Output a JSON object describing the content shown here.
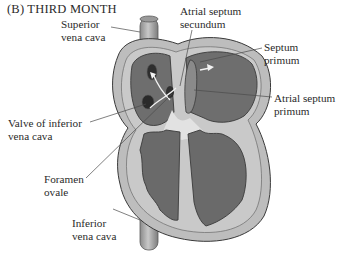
{
  "title": "(B)  THIRD MONTH",
  "labels": {
    "superior_vena_cava": "Superior\nvena cava",
    "atrial_septum_secundum": "Atrial septum\nsecundum",
    "septum_primum": "Septum\nprimum",
    "atrial_septum_primum": "Atrial septum\nprimum",
    "valve_of_inferior_vena_cava": "Valve of inferior\nvena cava",
    "foramen_ovale": "Foramen\novale",
    "inferior_vena_cava": "Inferior\nvena cava"
  },
  "colors": {
    "wall": "#b9b9b9",
    "chamber": "#6d6d6d",
    "outline": "#3c3c3c",
    "vessel": "#a8a8a8",
    "septum_light": "#dcdcdc",
    "leader": "#555555"
  }
}
